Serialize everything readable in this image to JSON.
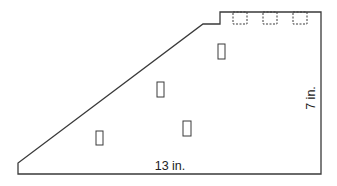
{
  "diagram": {
    "colors": {
      "stroke": "#3a3a3a",
      "text": "#222222",
      "background": "#ffffff"
    },
    "labels": {
      "bottom_dimension": "13 in.",
      "right_dimension": "7 in."
    },
    "outline_points": "18,174 18,163 203,24 220,24 220,12 321,12 321,174",
    "solid_rectangles": [
      {
        "x": 96,
        "y": 131,
        "w": 7,
        "h": 14
      },
      {
        "x": 183,
        "y": 121,
        "w": 8,
        "h": 15
      },
      {
        "x": 157,
        "y": 82,
        "w": 7,
        "h": 15
      },
      {
        "x": 218,
        "y": 44,
        "w": 7,
        "h": 15
      }
    ],
    "dashed_rectangles": [
      {
        "x": 233,
        "y": 12,
        "w": 14,
        "h": 12
      },
      {
        "x": 263,
        "y": 12,
        "w": 14,
        "h": 12
      },
      {
        "x": 293,
        "y": 12,
        "w": 14,
        "h": 12
      }
    ]
  }
}
